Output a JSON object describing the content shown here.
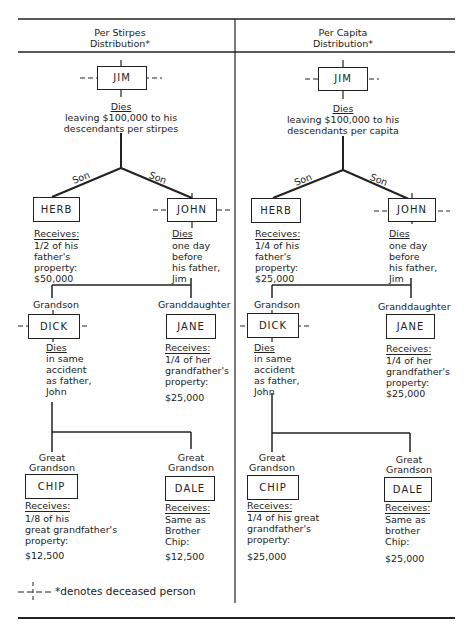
{
  "headers": {
    "left": {
      "line1": "Per Stirpes",
      "line2": "Distribution*"
    },
    "right": {
      "line1": "Per Capita",
      "line2": "Distribution*"
    }
  },
  "per_stirpes": {
    "jim": {
      "name": "JIM",
      "status": "Dies",
      "note1": "leaving $100,000 to his",
      "note2": "descendants per stirpes"
    },
    "son_labels": [
      "Son",
      "Son"
    ],
    "herb": {
      "name": "HERB",
      "heading": "Receives:",
      "lines": [
        "1/2 of his",
        "father's",
        "property:",
        "$50,000"
      ]
    },
    "john": {
      "name": "JOHN",
      "heading": "Dies",
      "lines": [
        "one day",
        "before",
        "his father,",
        "Jim"
      ]
    },
    "grandson_label": "Grandson",
    "granddaughter_label": "Granddaughter",
    "dick": {
      "name": "DICK",
      "heading": "Dies",
      "lines": [
        "in same",
        "accident",
        "as father,",
        "John"
      ]
    },
    "jane": {
      "name": "JANE",
      "heading": "Receives:",
      "lines": [
        "1/4 of her",
        "grandfather's",
        "property:"
      ],
      "amount": "$25,000"
    },
    "great_grandson_label": [
      "Great",
      "Grandson"
    ],
    "chip": {
      "name": "CHIP",
      "heading": "Receives:",
      "lines": [
        "1/8 of his",
        "great grandfather's",
        "property:"
      ],
      "amount": "$12,500"
    },
    "dale": {
      "name": "DALE",
      "heading": "Receives:",
      "lines": [
        "Same as",
        "Brother",
        "Chip:"
      ],
      "amount": "$12,500"
    }
  },
  "per_capita": {
    "jim": {
      "name": "JIM",
      "status": "Dies",
      "note1": "leaving $100,000 to his",
      "note2": "descendants per capita"
    },
    "son_labels": [
      "Son",
      "Son"
    ],
    "herb": {
      "name": "HERB",
      "heading": "Receives:",
      "lines": [
        "1/4 of his",
        "father's",
        "property:",
        "$25,000"
      ]
    },
    "john": {
      "name": "JOHN",
      "heading": "Dies",
      "lines": [
        "one day",
        "before",
        "his father,",
        "Jim"
      ]
    },
    "grandson_label": "Grandson",
    "granddaughter_label": "Granddaughter",
    "dick": {
      "name": "DICK",
      "heading": "Dies",
      "lines": [
        "in same",
        "accident",
        "as father,",
        "John"
      ]
    },
    "jane": {
      "name": "JANE",
      "heading": "Receives:",
      "lines": [
        "1/4 of her",
        "grandfather's",
        "property:",
        "$25,000"
      ]
    },
    "great_grandson_label": [
      "Great",
      "Grandson"
    ],
    "chip": {
      "name": "CHIP",
      "heading": "Receives:",
      "lines": [
        "1/4 of his great",
        "grandfather's",
        "property:"
      ],
      "amount": "$25,000"
    },
    "dale": {
      "name": "DALE",
      "heading": "Receives:",
      "lines": [
        "Same as",
        "brother",
        "Chip:"
      ],
      "amount": "$25,000"
    }
  },
  "legend": {
    "text": "*denotes deceased person"
  }
}
